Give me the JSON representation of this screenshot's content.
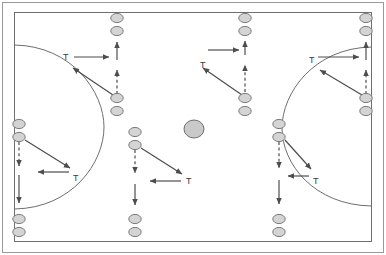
{
  "diagram": {
    "type": "pitch-drill",
    "canvas": {
      "width": 386,
      "height": 255,
      "background": "#ffffff"
    },
    "colors": {
      "frame_outer": "#9a9a9a",
      "pitch_line": "#6e6e6e",
      "arrow_solid": "#4d4d4d",
      "arrow_dashed": "#4d4d4d",
      "cone_fill": "#d4d4d4",
      "cone_stroke": "#7a7a7a",
      "ball_fill": "#c9c9c9",
      "ball_stroke": "#6e6e6e",
      "label_text": "#3a3a3a"
    },
    "pitch": {
      "outer_frame": {
        "x": 2,
        "y": 2,
        "width": 382,
        "height": 251
      },
      "boundary": {
        "x": 14,
        "y": 12,
        "width": 358,
        "height": 230
      },
      "left_arc_label": "left-penalty-arc",
      "right_arc_label": "right-penalty-arc"
    },
    "labels": [
      {
        "id": "t-top-left",
        "text": "T",
        "x": 63,
        "y": 53
      },
      {
        "id": "t-bottom-left",
        "text": "T",
        "x": 73,
        "y": 174
      },
      {
        "id": "t-top-middle",
        "text": "T",
        "x": 200,
        "y": 61
      },
      {
        "id": "t-bottom-middle",
        "text": "T",
        "x": 186,
        "y": 177
      },
      {
        "id": "t-top-right",
        "text": "T",
        "x": 309,
        "y": 56
      },
      {
        "id": "t-bottom-right",
        "text": "T",
        "x": 313,
        "y": 177
      }
    ],
    "cones": [
      {
        "id": "cone-top-col1-a",
        "cx": 117,
        "cy": 18
      },
      {
        "id": "cone-top-col1-b",
        "cx": 117,
        "cy": 31
      },
      {
        "id": "cone-top-col1-c",
        "cx": 117,
        "cy": 98
      },
      {
        "id": "cone-top-col1-d",
        "cx": 117,
        "cy": 111
      },
      {
        "id": "cone-top-col2-a",
        "cx": 245,
        "cy": 18
      },
      {
        "id": "cone-top-col2-b",
        "cx": 245,
        "cy": 31
      },
      {
        "id": "cone-top-col2-c",
        "cx": 245,
        "cy": 98
      },
      {
        "id": "cone-top-col2-d",
        "cx": 245,
        "cy": 111
      },
      {
        "id": "cone-top-col3-a",
        "cx": 366,
        "cy": 18
      },
      {
        "id": "cone-top-col3-b",
        "cx": 366,
        "cy": 31
      },
      {
        "id": "cone-top-col3-c",
        "cx": 366,
        "cy": 98
      },
      {
        "id": "cone-top-col3-d",
        "cx": 366,
        "cy": 111
      },
      {
        "id": "cone-bot-col0-a",
        "cx": 19,
        "cy": 124
      },
      {
        "id": "cone-bot-col0-b",
        "cx": 19,
        "cy": 137
      },
      {
        "id": "cone-bot-col0-c",
        "cx": 19,
        "cy": 219
      },
      {
        "id": "cone-bot-col0-d",
        "cx": 19,
        "cy": 232
      },
      {
        "id": "cone-bot-col1-a",
        "cx": 135,
        "cy": 132
      },
      {
        "id": "cone-bot-col1-b",
        "cx": 135,
        "cy": 145
      },
      {
        "id": "cone-bot-col1-c",
        "cx": 135,
        "cy": 219
      },
      {
        "id": "cone-bot-col1-d",
        "cx": 135,
        "cy": 232
      },
      {
        "id": "cone-bot-col2-a",
        "cx": 279,
        "cy": 124
      },
      {
        "id": "cone-bot-col2-b",
        "cx": 279,
        "cy": 137
      },
      {
        "id": "cone-bot-col2-c",
        "cx": 279,
        "cy": 219
      },
      {
        "id": "cone-bot-col2-d",
        "cx": 279,
        "cy": 232
      }
    ],
    "ball": {
      "id": "center-ball",
      "cx": 194,
      "cy": 129,
      "rx": 10,
      "ry": 9
    },
    "arrows_solid": [
      {
        "id": "arrow-tl-right",
        "x1": 74,
        "y1": 57,
        "x2": 109,
        "y2": 57
      },
      {
        "id": "arrow-tl-diag",
        "x1": 113,
        "y1": 95,
        "x2": 73,
        "y2": 68
      },
      {
        "id": "arrow-tl-up",
        "x1": 117,
        "y1": 60,
        "x2": 117,
        "y2": 42
      },
      {
        "id": "arrow-tm-right",
        "x1": 208,
        "y1": 50,
        "x2": 239,
        "y2": 50
      },
      {
        "id": "arrow-tm-diag",
        "x1": 242,
        "y1": 95,
        "x2": 203,
        "y2": 68
      },
      {
        "id": "arrow-tm-up",
        "x1": 245,
        "y1": 55,
        "x2": 245,
        "y2": 41
      },
      {
        "id": "arrow-tr-right",
        "x1": 318,
        "y1": 57,
        "x2": 359,
        "y2": 57
      },
      {
        "id": "arrow-tr-diag",
        "x1": 362,
        "y1": 95,
        "x2": 320,
        "y2": 70
      },
      {
        "id": "arrow-tr-up",
        "x1": 366,
        "y1": 60,
        "x2": 366,
        "y2": 42
      },
      {
        "id": "arrow-bl-diag",
        "x1": 25,
        "y1": 140,
        "x2": 70,
        "y2": 168
      },
      {
        "id": "arrow-bl-left",
        "x1": 69,
        "y1": 172,
        "x2": 38,
        "y2": 172
      },
      {
        "id": "arrow-bl-down",
        "x1": 19,
        "y1": 175,
        "x2": 19,
        "y2": 203
      },
      {
        "id": "arrow-bm-diag",
        "x1": 141,
        "y1": 148,
        "x2": 182,
        "y2": 174
      },
      {
        "id": "arrow-bm-left",
        "x1": 181,
        "y1": 181,
        "x2": 150,
        "y2": 181
      },
      {
        "id": "arrow-bm-down",
        "x1": 135,
        "y1": 184,
        "x2": 135,
        "y2": 205
      },
      {
        "id": "arrow-br-diag",
        "x1": 285,
        "y1": 140,
        "x2": 311,
        "y2": 169
      },
      {
        "id": "arrow-br-left",
        "x1": 309,
        "y1": 176,
        "x2": 288,
        "y2": 176
      },
      {
        "id": "arrow-br-down",
        "x1": 279,
        "y1": 180,
        "x2": 279,
        "y2": 204
      }
    ],
    "arrows_dashed": [
      {
        "id": "dashed-tl-up",
        "x1": 117,
        "y1": 94,
        "x2": 117,
        "y2": 70
      },
      {
        "id": "dashed-tm-up",
        "x1": 245,
        "y1": 92,
        "x2": 245,
        "y2": 65
      },
      {
        "id": "dashed-tr-up",
        "x1": 366,
        "y1": 94,
        "x2": 366,
        "y2": 70
      },
      {
        "id": "dashed-bl-dn",
        "x1": 19,
        "y1": 142,
        "x2": 19,
        "y2": 166
      },
      {
        "id": "dashed-bm-dn",
        "x1": 135,
        "y1": 150,
        "x2": 135,
        "y2": 173
      },
      {
        "id": "dashed-br-dn",
        "x1": 279,
        "y1": 142,
        "x2": 279,
        "y2": 168
      }
    ]
  }
}
